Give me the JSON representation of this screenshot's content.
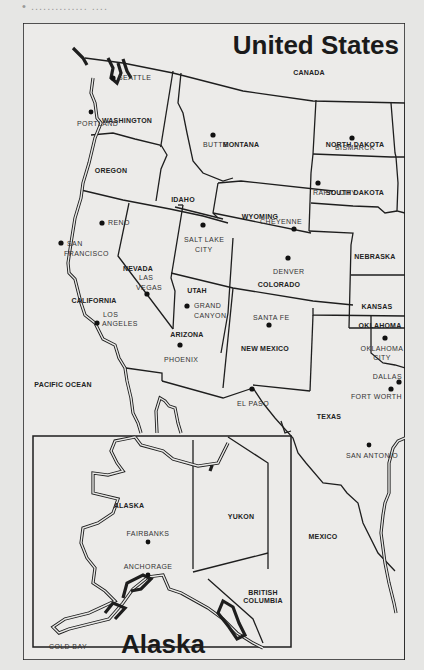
{
  "page": {
    "caption": "• ..............  ....",
    "background": "#e6e6e4",
    "ink_color": "#1e1e1e"
  },
  "map": {
    "title": "United States",
    "inset_title": "Alaska",
    "regions": {
      "canada": "CANADA",
      "washington": "WASHINGTON",
      "oregon": "OREGON",
      "idaho": "IDAHO",
      "montana": "MONTANA",
      "north_dakota": "NORTH DAKOTA",
      "south_dakota": "SOUTH DAKOTA",
      "wyoming": "WYOMING",
      "nebraska": "NEBRASKA",
      "nevada": "NEVADA",
      "california": "CALIFORNIA",
      "utah": "UTAH",
      "colorado": "COLORADO",
      "kansas": "KANSAS",
      "arizona": "ARIZONA",
      "new_mexico": "NEW MEXICO",
      "oklahoma": "OKLAHOMA",
      "texas": "TEXAS",
      "mexico": "MEXICO",
      "pacific_ocean": "PACIFIC OCEAN",
      "alaska": "ALASKA",
      "yukon": "YUKON",
      "british_columbia_1": "BRITISH",
      "british_columbia_2": "COLUMBIA"
    },
    "cities": {
      "seattle": "SEATTLE",
      "portland": "PORTLAND",
      "butte": "BUTTE",
      "bismarck": "BISMARCK",
      "rapid_city": "RAPID CITY",
      "reno": "RENO",
      "san_francisco_1": "SAN",
      "san_francisco_2": "FRANCISCO",
      "salt_lake_city_1": "SALT LAKE",
      "salt_lake_city_2": "CITY",
      "cheyenne": "CHEYENNE",
      "denver": "DENVER",
      "las_vegas_1": "LAS",
      "las_vegas_2": "VEGAS",
      "los_angeles_1": "LOS",
      "los_angeles_2": "ANGELES",
      "grand_canyon_1": "GRAND",
      "grand_canyon_2": "CANYON",
      "phoenix": "PHOENIX",
      "santa_fe": "SANTA FE",
      "el_paso": "EL PASO",
      "oklahoma_city_1": "OKLAHOMA",
      "oklahoma_city_2": "CITY",
      "dallas": "DALLAS",
      "fort_worth": "FORT WORTH",
      "san_antonio": "SAN ANTONIO",
      "fairbanks": "FAIRBANKS",
      "anchorage": "ANCHORAGE",
      "cold_bay": "COLD BAY"
    }
  }
}
